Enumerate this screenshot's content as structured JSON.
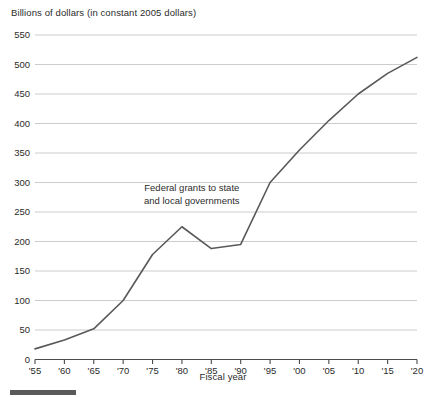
{
  "chart_data": {
    "type": "line",
    "title": "Billions of dollars (in constant 2005 dollars)",
    "xlabel": "Fiscal year",
    "ylabel": "",
    "grid": true,
    "legend": "none",
    "xlim": [
      1955,
      2020
    ],
    "ylim": [
      0,
      550
    ],
    "ytick_values": [
      0,
      50,
      100,
      150,
      200,
      250,
      300,
      350,
      400,
      450,
      500,
      550
    ],
    "ytick_labels": [
      "0",
      "50",
      "100",
      "150",
      "200",
      "250",
      "300",
      "350",
      "400",
      "450",
      "500",
      "550"
    ],
    "xtick_values": [
      1955,
      1960,
      1965,
      1970,
      1975,
      1980,
      1985,
      1990,
      1995,
      2000,
      2005,
      2010,
      2015,
      2020
    ],
    "xtick_labels": [
      "'55",
      "'60",
      "'65",
      "'70",
      "'75",
      "'80",
      "'85",
      "'90",
      "'95",
      "'00",
      "'05",
      "'10",
      "'15",
      "'20"
    ],
    "series": [
      {
        "name": "Federal grants to state and local governments",
        "color": "#595959",
        "x": [
          1955,
          1960,
          1965,
          1970,
          1975,
          1980,
          1985,
          1990,
          1995,
          2000,
          2005,
          2010,
          2015,
          2020
        ],
        "values": [
          18,
          33,
          52,
          100,
          178,
          225,
          188,
          195,
          300,
          355,
          405,
          450,
          485,
          512
        ]
      }
    ],
    "annotations": [
      {
        "line1": "Federal grants to state",
        "line2": "and local governments"
      }
    ]
  },
  "footer": {
    "bar_color": "#5a5a5a"
  }
}
